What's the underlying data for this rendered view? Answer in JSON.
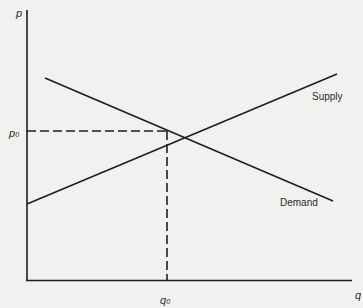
{
  "diagram": {
    "title": "",
    "type": "supply-demand",
    "axes": {
      "y_label": "p",
      "x_label": "q"
    },
    "equilibrium": {
      "price_label": "p",
      "price_subscript": "0",
      "quantity_label": "q",
      "quantity_subscript": "0"
    },
    "curves": [
      {
        "name": "Supply",
        "label": "Supply",
        "slope": "upward"
      },
      {
        "name": "Demand",
        "label": "Demand",
        "slope": "downward"
      }
    ],
    "colors": {
      "background": "#f1f1ef",
      "ink": "#1e1e1e"
    }
  }
}
